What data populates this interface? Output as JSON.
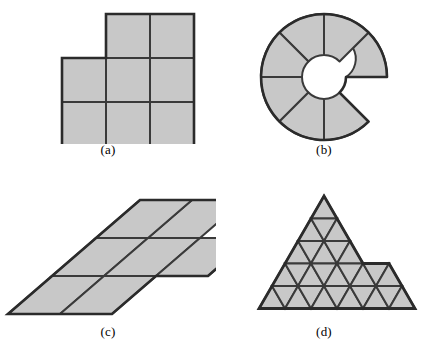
{
  "figure_panel": {
    "title": "",
    "background_color": "#ffffff",
    "fill_color": "#c8c8c8",
    "stroke_color": "#3a3a3a",
    "outer_stroke_color": "#2b2b2b",
    "panels": [
      {
        "id": "a",
        "label": "(a)",
        "caption": "",
        "shape_kind": "square-polyomino",
        "description": "3 by 3 grid of unit squares with the top-left square removed (8 squares)",
        "cell_count": 8,
        "grid": {
          "rows": 3,
          "cols": 3,
          "missing_cells": [
            [
              0,
              0
            ]
          ]
        }
      },
      {
        "id": "b",
        "label": "(b)",
        "caption": "",
        "shape_kind": "annulus-sectors",
        "description": "Annular ring divided into 8 equal sectors with one sector removed (7 sectors)",
        "cell_count": 7,
        "sectors_total": 8,
        "sectors_missing": 1,
        "inner_radius": 22,
        "outer_radius": 63
      },
      {
        "id": "c",
        "label": "(c)",
        "caption": "",
        "shape_kind": "rhombus-polyform",
        "description": "3 by 3 grid of slanted rhombi with the top-left and bottom-right rhombi removed (7 rhombi)",
        "cell_count": 7,
        "grid": {
          "rows": 3,
          "cols": 3,
          "missing_cells": [
            [
              0,
              0
            ],
            [
              2,
              2
            ]
          ]
        },
        "skew_degrees": 52
      },
      {
        "id": "d",
        "label": "(d)",
        "caption": "",
        "shape_kind": "triangle-polyiamond",
        "description": "Array of equilateral triangles forming a stepped polyiamond with a lower-right arm",
        "cell_count": 40,
        "rows": 5
      }
    ]
  }
}
